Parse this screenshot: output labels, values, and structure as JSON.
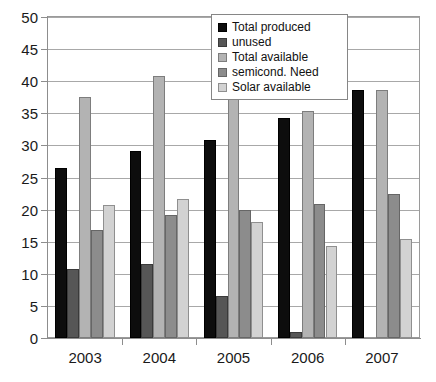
{
  "chart_data": {
    "type": "bar",
    "title": "",
    "subtitle": "",
    "xlabel": "",
    "ylabel": "",
    "categories": [
      "2003",
      "2004",
      "2005",
      "2006",
      "2007"
    ],
    "series": [
      {
        "name": "Total produced",
        "color": "#0d0d0d",
        "values": [
          26.5,
          29.2,
          30.9,
          34.3,
          38.6
        ]
      },
      {
        "name": "unused",
        "color": "#565656",
        "values": [
          10.7,
          11.6,
          6.6,
          1.0,
          0
        ]
      },
      {
        "name": "Total available",
        "color": "#b3b3b3",
        "values": [
          37.6,
          40.8,
          44.3,
          35.4,
          38.6
        ]
      },
      {
        "name": "semicond. Need",
        "color": "#8c8c8c",
        "values": [
          16.8,
          19.2,
          19.9,
          20.9,
          22.5
        ]
      },
      {
        "name": "Solar available",
        "color": "#d2d2d2",
        "values": [
          20.7,
          21.6,
          18.1,
          14.3,
          15.4
        ]
      }
    ],
    "ylim": [
      0,
      50
    ],
    "yticks": [
      0,
      5,
      10,
      15,
      20,
      25,
      30,
      35,
      40,
      45,
      50
    ],
    "ytick_labels": [
      "0",
      "5",
      "10",
      "15",
      "20",
      "25",
      "30",
      "35",
      "40",
      "45",
      "50"
    ],
    "grid": true,
    "grid_axis": "y",
    "legend_position": "top-right",
    "legend_entries": [
      "Total produced",
      "unused",
      "Total available",
      "semicond. Need",
      "Solar available"
    ],
    "background_color": "#ffffff",
    "frame_color": "#9a9a9a"
  }
}
